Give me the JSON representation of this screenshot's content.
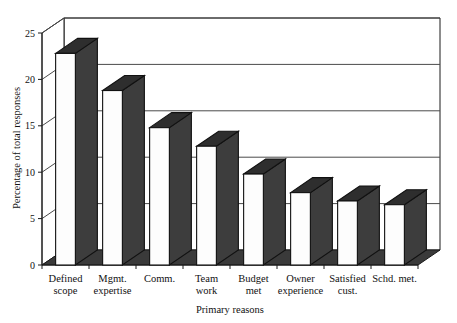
{
  "chart_data": {
    "type": "bar",
    "title": "",
    "subtitle": "",
    "xlabel": "Primary reasons",
    "ylabel": "Percentage of total responses",
    "categories": [
      "Defined scope",
      "Mgmt. expertise",
      "Comm.",
      "Team work",
      "Budget met",
      "Owner experience",
      "Satisfied cust.",
      "Schd. met."
    ],
    "category_lines": [
      [
        "Defined",
        "scope"
      ],
      [
        "Mgmt.",
        "expertise"
      ],
      [
        "Comm.",
        ""
      ],
      [
        "Team",
        "work"
      ],
      [
        "Budget",
        "met"
      ],
      [
        "Owner",
        "experience"
      ],
      [
        "Satisfied",
        "cust."
      ],
      [
        "Schd. met.",
        ""
      ]
    ],
    "values": [
      22.8,
      18.8,
      14.8,
      12.8,
      9.8,
      7.8,
      6.9,
      6.5
    ],
    "ylim": [
      0,
      25
    ],
    "xlim": [
      0,
      8
    ],
    "ytick_values": [
      0,
      5,
      10,
      15,
      20,
      25
    ],
    "ytick_labels": [
      "0",
      "5",
      "10",
      "15",
      "20",
      "25"
    ],
    "grid": true,
    "grid_axis": "y",
    "legend": false,
    "legend_position": "none",
    "style": "3d-column",
    "bar_face_color": "#fdfdfd",
    "bar_side_color": "#3d3d3d",
    "bar_top_color": "#2e2e2e",
    "floor_color": "#3a3a3a",
    "wall_color": "#ffffff",
    "axis_color": "#1a1a1a",
    "background_color": "#ffffff"
  },
  "figure": {
    "canvas_width": 457,
    "canvas_height": 323
  }
}
